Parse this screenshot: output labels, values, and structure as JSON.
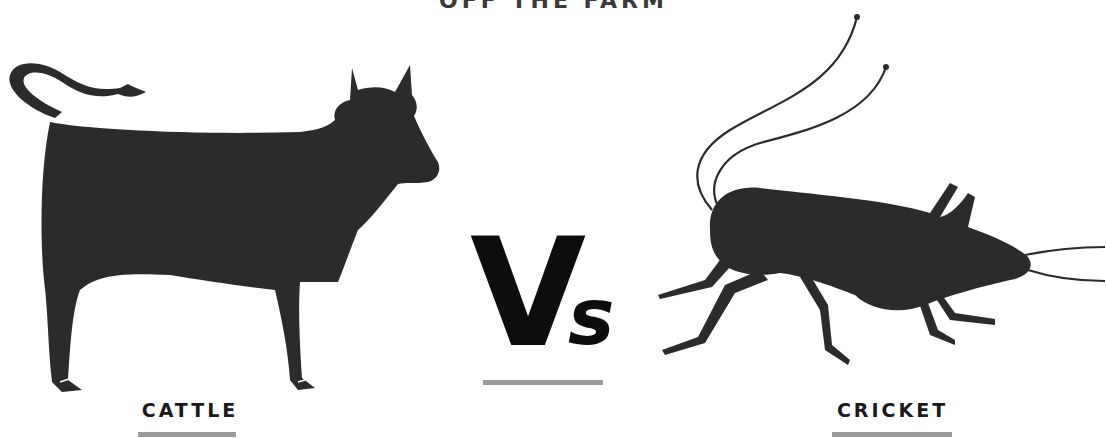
{
  "header": {
    "title": "OFF THE FARM"
  },
  "comparison": {
    "left": {
      "label": "CATTLE",
      "icon": "cow-silhouette-icon"
    },
    "center": {
      "v": "V",
      "s": "s"
    },
    "right": {
      "label": "CRICKET",
      "icon": "cricket-silhouette-icon"
    }
  },
  "colors": {
    "silhouette": "#2b2b2b",
    "text": "#1a1a1a",
    "underline": "#9a9a9a",
    "background": "#ffffff"
  }
}
